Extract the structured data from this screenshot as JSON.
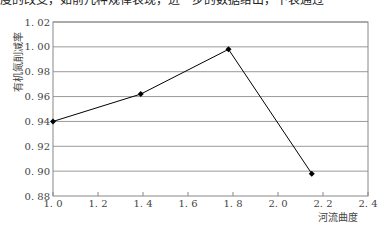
{
  "header": {
    "cropped_text": "度的改变，如前几种规律表现，进一步的数据给出，下表通过"
  },
  "chart_data": {
    "type": "line",
    "title": "",
    "xlabel": "河流曲度",
    "ylabel": "有机氮削减率",
    "x": [
      1.0,
      1.39,
      1.78,
      2.15
    ],
    "series": [
      {
        "name": "有机氮削减率",
        "values": [
          0.94,
          0.962,
          0.998,
          0.898
        ],
        "marker": "diamond",
        "color": "#000000"
      }
    ],
    "xlim": [
      1.0,
      2.4
    ],
    "ylim": [
      0.88,
      1.02
    ],
    "xticks": [
      "1.0",
      "1.2",
      "1.4",
      "1.6",
      "1.8",
      "2.0",
      "2.2",
      "2.4"
    ],
    "yticks": [
      "0.88",
      "0.90",
      "0.92",
      "0.94",
      "0.96",
      "0.98",
      "1.00",
      "1.02"
    ],
    "grid": "horizontal",
    "legend": "none"
  }
}
